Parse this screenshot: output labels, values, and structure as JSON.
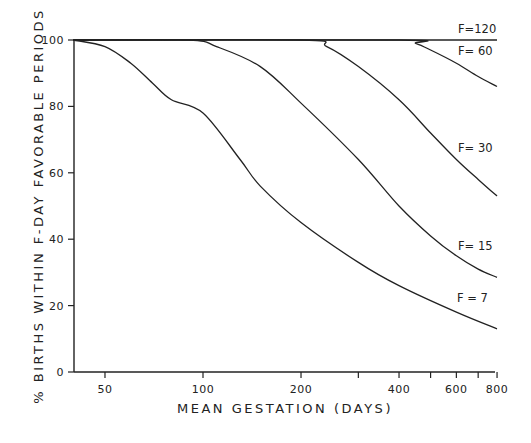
{
  "chart_data": {
    "type": "line",
    "title": "",
    "xlabel": "MEAN GESTATION (DAYS)",
    "ylabel": "% BIRTHS WITHIN F-DAY FAVORABLE PERIODS",
    "xscale": "log",
    "xlim": [
      40,
      800
    ],
    "ylim": [
      0,
      100
    ],
    "x_ticks": [
      50,
      100,
      200,
      300,
      400,
      500,
      600,
      700,
      800
    ],
    "x_tick_labels": [
      "50",
      "100",
      "200",
      "",
      "400",
      "",
      "600",
      "",
      "800"
    ],
    "y_ticks": [
      0,
      20,
      40,
      60,
      80,
      100
    ],
    "y_tick_labels": [
      "0",
      "20",
      "40",
      "60",
      "80",
      "100"
    ],
    "grid": false,
    "legend": "inline labels at right end of curves",
    "series": [
      {
        "name": "F=120",
        "label": "F=120",
        "x": [
          40,
          800
        ],
        "values": [
          100,
          100
        ]
      },
      {
        "name": "F=60",
        "label": "F= 60",
        "x": [
          40,
          400,
          450,
          500,
          600,
          700,
          800
        ],
        "values": [
          100,
          100,
          99,
          97,
          93,
          89,
          86
        ]
      },
      {
        "name": "F=30",
        "label": "F= 30",
        "x": [
          40,
          200,
          240,
          300,
          400,
          500,
          600,
          700,
          800
        ],
        "values": [
          100,
          100,
          98,
          92,
          82,
          72,
          64,
          58,
          53
        ]
      },
      {
        "name": "F=15",
        "label": "F= 15",
        "x": [
          40,
          90,
          110,
          150,
          200,
          300,
          400,
          500,
          600,
          700,
          800
        ],
        "values": [
          100,
          100,
          98,
          92,
          81,
          64,
          50,
          41,
          35,
          31,
          28.5
        ]
      },
      {
        "name": "F=7",
        "label": "F = 7",
        "x": [
          40,
          50,
          60,
          70,
          80,
          100,
          130,
          150,
          200,
          300,
          400,
          600,
          800
        ],
        "values": [
          100,
          98,
          93,
          87,
          82,
          78,
          64,
          56,
          45,
          33,
          26,
          18,
          13
        ]
      }
    ]
  }
}
